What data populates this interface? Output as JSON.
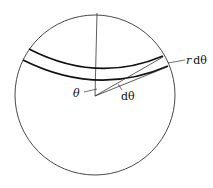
{
  "diagram": {
    "type": "geometry",
    "colors": {
      "stroke": "#222222",
      "background": "#ffffff"
    },
    "circle": {
      "cx": 95,
      "cy": 95,
      "r": 80
    },
    "center": {
      "x": 95,
      "y": 96
    },
    "labels": {
      "theta": "θ",
      "dtheta": "dθ",
      "r_dtheta_r": "r",
      "r_dtheta_d": "dθ"
    }
  }
}
